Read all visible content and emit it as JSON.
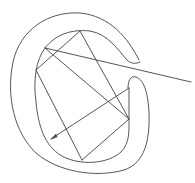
{
  "diagram": {
    "stroke_color": "#555555",
    "background": "#ffffff",
    "vertices": {
      "top": [
        80,
        31
      ],
      "upper_left": [
        45,
        48
      ],
      "left": [
        36,
        70
      ],
      "right_upper": [
        129,
        88
      ],
      "right_lower": [
        129,
        119
      ],
      "bottom": [
        82,
        160
      ],
      "arrow_tip": [
        51,
        139
      ],
      "line_end": [
        191,
        82
      ]
    },
    "segments": [
      {
        "name": "top-to-upper-left-chord",
        "from": "top",
        "to": "left"
      },
      {
        "name": "top-to-right-lower-chord",
        "from": "top",
        "to": "right_lower"
      },
      {
        "name": "upper-left-to-line-end",
        "from": "upper_left",
        "to": "line_end"
      },
      {
        "name": "upper-left-to-right-lower",
        "from": "upper_left",
        "to": "right_lower"
      },
      {
        "name": "left-to-bottom",
        "from": "left",
        "to": "bottom"
      },
      {
        "name": "right-lower-to-bottom",
        "from": "right_lower",
        "to": "bottom"
      },
      {
        "name": "right-upper-to-arrow-tip",
        "from": "right_upper",
        "to": "arrow_tip"
      }
    ]
  }
}
